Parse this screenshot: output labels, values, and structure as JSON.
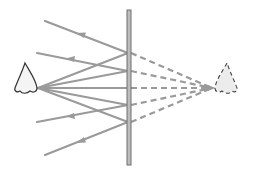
{
  "diagram": {
    "title": "",
    "colors": {
      "ray": "#9a9a9a",
      "mirror": "#bdbdbd",
      "mirror_edge": "#6e6e6e",
      "outline": "#333333",
      "background": "#ffffff"
    },
    "objects": {
      "real_nose": {
        "label": "",
        "position": "left"
      },
      "mirror": {
        "label": "",
        "orientation": "vertical"
      },
      "virtual_nose": {
        "label": "",
        "position": "right",
        "style": "dashed"
      }
    },
    "rays": {
      "count": 5,
      "mirror_points_y": [
        53,
        71,
        88,
        105,
        122
      ],
      "reflected_end_points": [
        [
          45,
          20
        ],
        [
          37,
          52
        ],
        [
          37,
          88
        ],
        [
          37,
          122
        ],
        [
          45,
          155
        ]
      ],
      "virtual_image_point": [
        215,
        88
      ]
    }
  }
}
